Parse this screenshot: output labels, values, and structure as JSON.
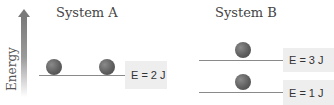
{
  "axis": {
    "label": "Energy",
    "icon": "up-arrow-icon"
  },
  "systems": [
    {
      "title": "System A",
      "levels": [
        {
          "label": "E = 2 J",
          "value_j": 2,
          "balls": 2
        }
      ]
    },
    {
      "title": "System B",
      "levels": [
        {
          "label": "E = 3 J",
          "value_j": 3,
          "balls": 1
        },
        {
          "label": "E = 1 J",
          "value_j": 1,
          "balls": 1
        }
      ]
    }
  ],
  "colors": {
    "line": "#8a8a8a",
    "ball": "#5f5f5f",
    "label_bg": "#eeeeee",
    "arrow": "#7a7a7a"
  }
}
